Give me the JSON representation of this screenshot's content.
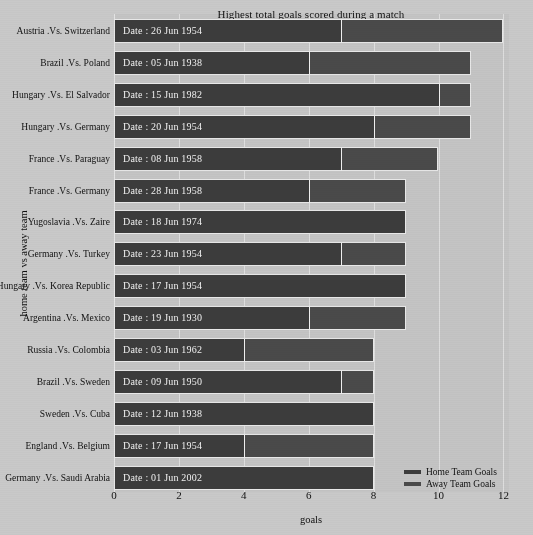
{
  "chart_data": {
    "type": "bar",
    "orientation": "horizontal",
    "stacked": true,
    "title": "Highest total goals scored during a match",
    "xlabel": "goals",
    "ylabel": "home team vs away team",
    "xlim": [
      0,
      12.5
    ],
    "xticks": [
      0,
      2,
      4,
      6,
      8,
      10,
      12
    ],
    "xtick_labels": [
      "0",
      "2",
      "4",
      "6",
      "8",
      "10",
      "12"
    ],
    "grid": true,
    "legend_position": "lower right",
    "legend": [
      {
        "label": "Home Team Goals",
        "color": "#3c3c3c"
      },
      {
        "label": "Away Team Goals",
        "color": "#4a4a4a"
      }
    ],
    "categories": [
      "Austria .Vs. Switzerland",
      "Brazil .Vs. Poland",
      "Hungary .Vs. El Salvador",
      "Hungary .Vs. Germany",
      "France .Vs. Paraguay",
      "France .Vs. Germany",
      "Yugoslavia .Vs. Zaire",
      "Germany .Vs. Turkey",
      "Hungary .Vs. Korea Republic",
      "Argentina .Vs. Mexico",
      "Russia .Vs. Colombia",
      "Brazil .Vs. Sweden",
      "Sweden .Vs. Cuba",
      "England .Vs. Belgium",
      "Germany .Vs. Saudi Arabia"
    ],
    "series": [
      {
        "name": "Home Team Goals",
        "values": [
          7,
          6,
          10,
          8,
          7,
          6,
          9,
          7,
          9,
          6,
          4,
          7,
          8,
          4,
          8
        ]
      },
      {
        "name": "Away Team Goals",
        "values": [
          5,
          5,
          1,
          3,
          3,
          3,
          0,
          2,
          0,
          3,
          4,
          1,
          0,
          4,
          0
        ]
      }
    ],
    "bar_labels": [
      "Date : 26 Jun 1954",
      "Date : 05 Jun 1938",
      "Date : 15 Jun 1982",
      "Date : 20 Jun 1954",
      "Date : 08 Jun 1958",
      "Date : 28 Jun 1958",
      "Date : 18 Jun 1974",
      "Date : 23 Jun 1954",
      "Date : 17 Jun 1954",
      "Date : 19 Jun 1930",
      "Date : 03 Jun 1962",
      "Date : 09 Jun 1950",
      "Date : 12 Jun 1938",
      "Date : 17 Jun 1954",
      "Date : 01 Jun 2002"
    ],
    "totals": [
      12,
      11,
      11,
      11,
      10,
      9,
      9,
      9,
      9,
      9,
      8,
      8,
      8,
      8,
      8
    ]
  },
  "colors": {
    "home": "#3c3c3c",
    "away": "#4a4a4a",
    "plot_background": "#c4c4c4",
    "figure_background": "#c9c9c9",
    "gridline": "#e3e3e3",
    "bar_text": "#f2f2f2"
  }
}
